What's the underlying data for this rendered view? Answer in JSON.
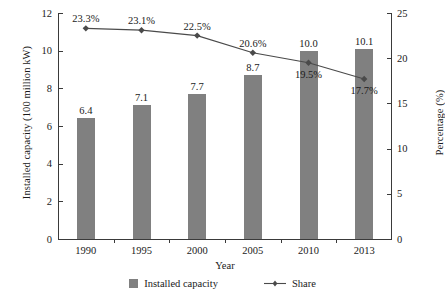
{
  "chart_data": {
    "type": "bar",
    "title": "",
    "subtitle": "",
    "xlabel": "Year",
    "ylabel": "Installed capacity (100 million kW)",
    "y2label": "Percentage (%)",
    "categories": [
      "1990",
      "1995",
      "2000",
      "2005",
      "2010",
      "2013"
    ],
    "ylim": [
      0,
      12
    ],
    "y2lim": [
      0,
      25
    ],
    "yticks": [
      "0",
      "2",
      "4",
      "6",
      "8",
      "10",
      "12"
    ],
    "y2ticks": [
      "0",
      "5",
      "10",
      "15",
      "20",
      "25"
    ],
    "grid": false,
    "legend_position": "bottom-center",
    "series": [
      {
        "name": "Installed capacity",
        "type": "bar",
        "axis": "left",
        "color": "#808080",
        "values": [
          6.4,
          7.1,
          7.7,
          8.7,
          10.0,
          10.1
        ],
        "labels": [
          "6.4",
          "7.1",
          "7.7",
          "8.7",
          "10.0",
          "10.1"
        ]
      },
      {
        "name": "Share",
        "type": "line",
        "axis": "right",
        "color": "#4a4a4a",
        "marker": "diamond",
        "values": [
          23.3,
          23.1,
          22.5,
          20.6,
          19.5,
          17.7
        ],
        "labels": [
          "23.3%",
          "23.1%",
          "22.5%",
          "20.6%",
          "19.5%",
          "17.7%"
        ]
      }
    ]
  },
  "legend": {
    "items": [
      {
        "label": "Installed capacity",
        "marker": "square-swatch",
        "color": "#808080"
      },
      {
        "label": "Share",
        "marker": "line-diamond",
        "color": "#4a4a4a"
      }
    ]
  },
  "colors": {
    "bar": "#808080",
    "line": "#4a4a4a",
    "axis": "#3a3a3a",
    "text": "#1a1a1a",
    "background": "#ffffff"
  }
}
